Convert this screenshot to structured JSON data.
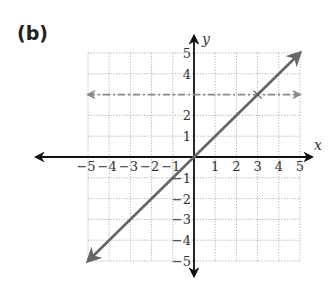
{
  "panel_label": "(b)",
  "chart_data": {
    "type": "line",
    "title": "",
    "xlabel": "x",
    "ylabel": "y",
    "xlim": [
      -5,
      5
    ],
    "ylim": [
      -5,
      5
    ],
    "grid": true,
    "x_ticks": [
      -5,
      -4,
      -3,
      -2,
      -1,
      1,
      2,
      3,
      4,
      5
    ],
    "y_ticks": [
      -5,
      -4,
      -3,
      -2,
      -1,
      1,
      2,
      4,
      5
    ],
    "series": [
      {
        "name": "y = x",
        "style": "solid",
        "color": "#666666",
        "x": [
          -5,
          5
        ],
        "y": [
          -5,
          5
        ],
        "arrows": "both"
      },
      {
        "name": "y = 3",
        "style": "dash-dot",
        "color": "#888888",
        "x": [
          -5,
          5
        ],
        "y": [
          3,
          3
        ],
        "arrows": "both"
      }
    ],
    "annotations": [
      {
        "type": "x-mark",
        "x": 3,
        "y": 3
      }
    ]
  }
}
